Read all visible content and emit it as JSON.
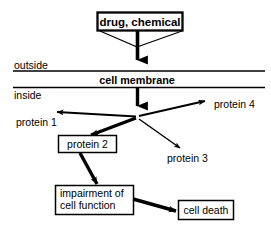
{
  "diagram": {
    "type": "flowchart",
    "title_text": "drug, chemical",
    "membrane": {
      "band_label": "cell membrane",
      "outside_label": "outside",
      "inside_label": "inside"
    },
    "nodes": {
      "drug": {
        "label": "drug, chemical",
        "bold": true,
        "boxed": true
      },
      "protein1": {
        "label": "protein 1",
        "bold": false,
        "boxed": false
      },
      "protein2": {
        "label": "protein 2",
        "bold": false,
        "boxed": true
      },
      "protein3": {
        "label": "protein 3",
        "bold": false,
        "boxed": false
      },
      "protein4": {
        "label": "protein 4",
        "bold": false,
        "boxed": false
      },
      "impairment": {
        "label_line1": "impairment of",
        "label_line2": "cell function",
        "bold": false,
        "boxed": true
      },
      "celldeath": {
        "label": "cell death",
        "bold": false,
        "boxed": true
      }
    },
    "edges": [
      {
        "from": "drug",
        "to": "membrane",
        "weight": "thick"
      },
      {
        "from": "drug-left-corner",
        "to": "drug-shaft",
        "weight": "thin"
      },
      {
        "from": "drug-right-corner",
        "to": "drug-shaft",
        "weight": "thin"
      },
      {
        "from": "membrane",
        "to": "branch-point",
        "weight": "thick"
      },
      {
        "from": "branch-point",
        "to": "protein1",
        "weight": "medium"
      },
      {
        "from": "branch-point",
        "to": "protein2",
        "weight": "thick"
      },
      {
        "from": "branch-point",
        "to": "protein3",
        "weight": "thin"
      },
      {
        "from": "branch-point",
        "to": "protein4",
        "weight": "medium"
      },
      {
        "from": "protein2",
        "to": "impairment",
        "weight": "thick"
      },
      {
        "from": "impairment",
        "to": "celldeath",
        "weight": "thick"
      }
    ],
    "colors": {
      "stroke": "#000000",
      "background": "#ffffff",
      "text": "#000000"
    }
  }
}
